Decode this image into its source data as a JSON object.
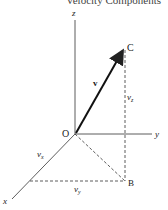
{
  "title": "Velocity Components",
  "labels": {
    "z_axis": "z",
    "y_axis": "y",
    "x_axis": "x",
    "origin": "O",
    "point_c": "C",
    "point_b": "B",
    "vector": "v",
    "vz": "v",
    "vz_sub": "z",
    "vx": "v",
    "vx_sub": "x",
    "vy": "v",
    "vy_sub": "y"
  },
  "colors": {
    "stroke": "#222222",
    "background": "#ffffff"
  }
}
